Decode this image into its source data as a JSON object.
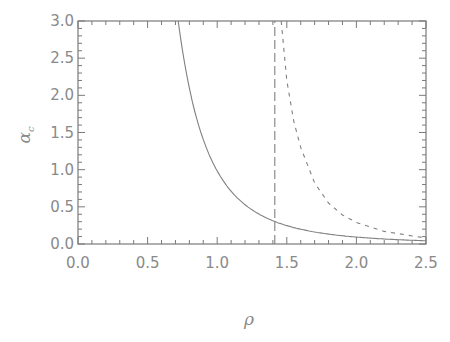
{
  "chart_data": {
    "type": "line",
    "title": "",
    "xlabel": "ρ",
    "ylabel": "α_c",
    "xlim": [
      0.0,
      2.5
    ],
    "ylim": [
      0.0,
      3.0
    ],
    "grid": false,
    "legend": null,
    "x_ticks": [
      "0.0",
      "0.5",
      "1.0",
      "1.5",
      "2.0",
      "2.5"
    ],
    "y_ticks": [
      "0.0",
      "0.5",
      "1.0",
      "1.5",
      "2.0",
      "2.5",
      "3.0"
    ],
    "series": [
      {
        "name": "solid",
        "style": "solid",
        "x": [
          0.72,
          0.8,
          0.9,
          1.0,
          1.1,
          1.2,
          1.3,
          1.414,
          1.6,
          1.8,
          2.0,
          2.2,
          2.5
        ],
        "y": [
          3.0,
          2.12,
          1.42,
          0.99,
          0.72,
          0.53,
          0.4,
          0.3,
          0.2,
          0.135,
          0.095,
          0.07,
          0.045
        ]
      },
      {
        "name": "long-dashed vertical",
        "style": "long-dash",
        "x": [
          1.414,
          1.414
        ],
        "y": [
          0.0,
          3.0
        ]
      },
      {
        "name": "short-dashed",
        "style": "short-dash",
        "x": [
          1.46,
          1.5,
          1.55,
          1.6,
          1.7,
          1.8,
          1.9,
          2.0,
          2.2,
          2.5
        ],
        "y": [
          3.0,
          2.2,
          1.65,
          1.3,
          0.82,
          0.55,
          0.39,
          0.29,
          0.17,
          0.08
        ]
      }
    ]
  },
  "labels": {
    "xlabel": "ρ",
    "ylabel_main": "α",
    "ylabel_sub": "c"
  }
}
